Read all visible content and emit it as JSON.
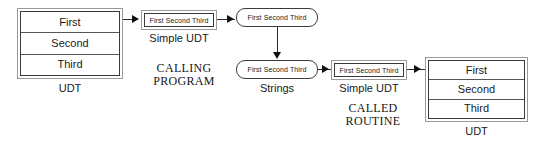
{
  "diagram": {
    "sections": [
      {
        "id": "calling-program",
        "label": "CALLING\nPROGRAM"
      },
      {
        "id": "called-routine",
        "label": "CALLED\nROUTINE"
      }
    ],
    "nodes": {
      "udt_source": {
        "caption": "UDT",
        "rows": [
          "First",
          "Second",
          "Third"
        ]
      },
      "simple_udt_out": {
        "caption": "Simple UDT",
        "text": "First Second Third"
      },
      "string_top": {
        "text": "First Second Third"
      },
      "string_bottom": {
        "caption": "Strings",
        "text": "First Second Third"
      },
      "simple_udt_in": {
        "caption": "Simple UDT",
        "text": "First Second Third"
      },
      "udt_target": {
        "caption": "UDT",
        "rows": [
          "First",
          "Second",
          "Third"
        ]
      }
    }
  },
  "colors": {
    "stroke_dark": "#3a3a3a",
    "stroke_light": "#9a9a9a",
    "arrow": "#111111",
    "text": "#1a1a1a",
    "background": "#ffffff"
  }
}
